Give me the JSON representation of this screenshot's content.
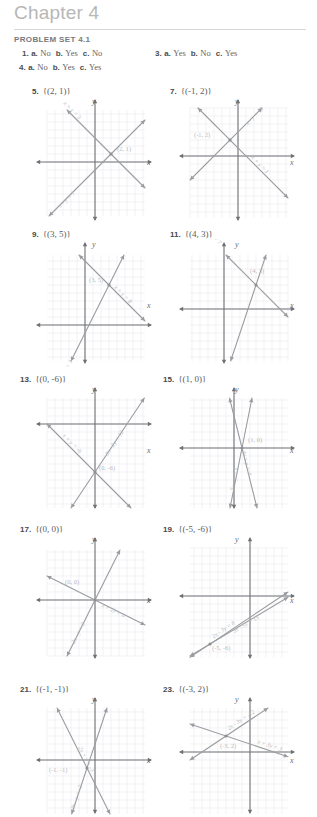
{
  "page": {
    "chapter_title": "Chapter 4",
    "problem_set_title": "PROBLEM SET 4.1",
    "axis_x_label": "x",
    "axis_y_label": "y",
    "colors": {
      "chapter_gray": "#b7b7b7",
      "rule_gray": "#d8d8d8",
      "heading_gray": "#77797c",
      "body_gray": "#5b5d60",
      "line_gray": "#9a9ca0",
      "grid_gray": "#e9e9ef",
      "axis_gray": "#6f7174"
    }
  },
  "multiple_choice_answers": [
    {
      "number": "1.",
      "parts": [
        {
          "letter": "a.",
          "value": "No"
        },
        {
          "letter": "b.",
          "value": "Yes"
        },
        {
          "letter": "c.",
          "value": "No"
        }
      ]
    },
    {
      "number": "3.",
      "parts": [
        {
          "letter": "a.",
          "value": "Yes"
        },
        {
          "letter": "b.",
          "value": "No"
        },
        {
          "letter": "c.",
          "value": "Yes"
        }
      ]
    },
    {
      "number": "4.",
      "parts": [
        {
          "letter": "a.",
          "value": "No"
        },
        {
          "letter": "b.",
          "value": "Yes"
        },
        {
          "letter": "c.",
          "value": "Yes"
        }
      ]
    }
  ],
  "graph_problems": [
    {
      "number": "5.",
      "solution_set": "{(2, 1)}",
      "point_label": "(2, 1)",
      "equations": [
        "x + y = 3",
        "x - y = 1"
      ]
    },
    {
      "number": "7.",
      "solution_set": "{(-1, 2)}",
      "point_label": "(-1, 2)",
      "equations": [
        "x + y = 1",
        "x - y = -3"
      ]
    },
    {
      "number": "9.",
      "solution_set": "{(3, 5)}",
      "point_label": "(3, 5)",
      "equations": [
        "x + y = 8",
        "2x - y = 1"
      ]
    },
    {
      "number": "11.",
      "solution_set": "{(4, 3)}",
      "point_label": "(4, 3)",
      "equations": [
        "x + y = 7",
        "3x - y = 9"
      ]
    },
    {
      "number": "13.",
      "solution_set": "{(0, -6)}",
      "point_label": "(0, -6)",
      "equations": [
        "x + y = -6",
        "3x - 2y = 12"
      ]
    },
    {
      "number": "15.",
      "solution_set": "{(1, 0)}",
      "point_label": "(1, 0)",
      "equations": [
        "4x + y = 4",
        "5x - y = 5"
      ]
    },
    {
      "number": "17.",
      "solution_set": "{(0, 0)}",
      "point_label": "(0, 0)",
      "equations": [
        "2x - y = 0",
        "x + 2y = 0"
      ]
    },
    {
      "number": "19.",
      "solution_set": "{(-5, -6)}",
      "point_label": "(-5, -6)",
      "equations": [
        "2x - 3y = 8",
        "3x - 5y = 15"
      ]
    },
    {
      "number": "21.",
      "solution_set": "{(-1, -1)}",
      "point_label": "(-1, -1)",
      "equations": [
        "3x - y = -2",
        "2x + y = -3"
      ]
    },
    {
      "number": "23.",
      "solution_set": "{(-3, 2)}",
      "point_label": "(-3, 2)",
      "equations": [
        "2x - 3y = -12",
        "x + 3y = 3"
      ]
    }
  ]
}
